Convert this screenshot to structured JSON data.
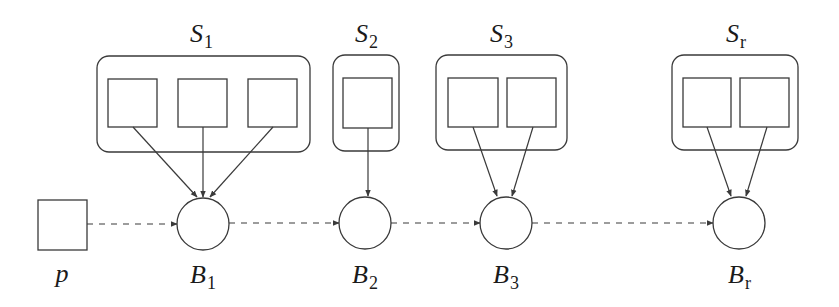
{
  "diagram": {
    "stroke_color": "#3a3a3a",
    "label_color": "#1a1a1a",
    "source": {
      "label": "p",
      "box": {
        "x": 38,
        "y": 200,
        "w": 49,
        "h": 50
      },
      "label_pos": {
        "x": 62,
        "y": 282
      }
    },
    "groups": [
      {
        "id": "S1",
        "label_main": "S",
        "label_sub": "1",
        "label_pos": {
          "x": 190,
          "y": 42
        },
        "outer": {
          "x": 97,
          "y": 56,
          "w": 213,
          "h": 96
        },
        "items": [
          {
            "x": 108,
            "y": 79,
            "w": 49,
            "h": 48
          },
          {
            "x": 178,
            "y": 79,
            "w": 49,
            "h": 48
          },
          {
            "x": 248,
            "y": 79,
            "w": 49,
            "h": 48
          }
        ],
        "block": {
          "label_main": "B",
          "label_sub": "1",
          "cx": 203,
          "cy": 224,
          "r": 26,
          "label_pos": {
            "x": 190,
            "y": 283
          }
        },
        "arrows": [
          {
            "x1": 133,
            "y1": 127,
            "x2": 197,
            "y2": 197
          },
          {
            "x1": 203,
            "y1": 127,
            "x2": 203,
            "y2": 197
          },
          {
            "x1": 273,
            "y1": 127,
            "x2": 210,
            "y2": 197
          }
        ]
      },
      {
        "id": "S2",
        "label_main": "S",
        "label_sub": "2",
        "label_pos": {
          "x": 355,
          "y": 42
        },
        "outer": {
          "x": 333,
          "y": 55,
          "w": 66,
          "h": 96
        },
        "items": [
          {
            "x": 343,
            "y": 78,
            "w": 49,
            "h": 50
          }
        ],
        "block": {
          "label_main": "B",
          "label_sub": "2",
          "cx": 365,
          "cy": 223,
          "r": 26,
          "label_pos": {
            "x": 352,
            "y": 283
          }
        },
        "arrows": [
          {
            "x1": 368,
            "y1": 128,
            "x2": 368,
            "y2": 196
          }
        ]
      },
      {
        "id": "S3",
        "label_main": "S",
        "label_sub": "3",
        "label_pos": {
          "x": 490,
          "y": 42
        },
        "outer": {
          "x": 436,
          "y": 55,
          "w": 131,
          "h": 95
        },
        "items": [
          {
            "x": 448,
            "y": 78,
            "w": 50,
            "h": 49
          },
          {
            "x": 507,
            "y": 78,
            "w": 49,
            "h": 49
          }
        ],
        "block": {
          "label_main": "B",
          "label_sub": "3",
          "cx": 506,
          "cy": 223,
          "r": 26,
          "label_pos": {
            "x": 493,
            "y": 283
          }
        },
        "arrows": [
          {
            "x1": 473,
            "y1": 127,
            "x2": 497,
            "y2": 196
          },
          {
            "x1": 533,
            "y1": 127,
            "x2": 512,
            "y2": 196
          }
        ]
      },
      {
        "id": "Sr",
        "label_main": "S",
        "label_sub": "r",
        "label_pos": {
          "x": 726,
          "y": 42
        },
        "outer": {
          "x": 672,
          "y": 55,
          "w": 126,
          "h": 95
        },
        "items": [
          {
            "x": 683,
            "y": 78,
            "w": 48,
            "h": 49
          },
          {
            "x": 740,
            "y": 78,
            "w": 49,
            "h": 49
          }
        ],
        "block": {
          "label_main": "B",
          "label_sub": "r",
          "cx": 739,
          "cy": 223,
          "r": 26,
          "label_pos": {
            "x": 728,
            "y": 283
          }
        },
        "arrows": [
          {
            "x1": 707,
            "y1": 127,
            "x2": 731,
            "y2": 196
          },
          {
            "x1": 767,
            "y1": 127,
            "x2": 746,
            "y2": 196
          }
        ]
      }
    ],
    "chain": [
      {
        "from": "p",
        "to": "B1",
        "x1": 87,
        "x2": 177,
        "y": 224
      },
      {
        "from": "B1",
        "to": "B2",
        "x1": 229,
        "x2": 339,
        "y": 223
      },
      {
        "from": "B2",
        "to": "B3",
        "x1": 391,
        "x2": 480,
        "y": 223
      },
      {
        "from": "B3",
        "to": "Br",
        "x1": 532,
        "x2": 713,
        "y": 223
      }
    ]
  }
}
